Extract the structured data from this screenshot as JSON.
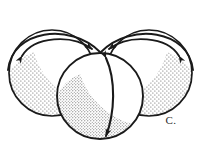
{
  "figure": {
    "panel_label": "C.",
    "background_color": "#ffffff",
    "ink_color": "#1a1a1a",
    "stipple_color": "#3a3a3a",
    "caption_color": "#2b2b2b"
  },
  "spheres": [
    {
      "id": "left-sphere",
      "name": "left-sphere",
      "center_x": 52,
      "center_y": 73,
      "radius_x": 43,
      "radius_y": 43,
      "shaded_region": "lower-left-crescent"
    },
    {
      "id": "right-sphere",
      "name": "right-sphere",
      "center_x": 149,
      "center_y": 73,
      "radius_x": 43,
      "radius_y": 43,
      "shaded_region": "lower-right-crescent"
    },
    {
      "id": "center-sphere",
      "name": "center-sphere",
      "center_x": 100,
      "center_y": 96,
      "radius_x": 43,
      "radius_y": 43,
      "shaded_region": "lower-left-crescent"
    }
  ],
  "arrows": [
    {
      "id": "left-arc-arrow",
      "name": "left-rotation-arc-arrow",
      "style": "double-headed-curved",
      "description": "curved arc above left sphere with arrowheads at both ends",
      "start_label": "left-outer-edge",
      "end_label": "center-sphere-apex"
    },
    {
      "id": "right-arc-arrow",
      "name": "right-rotation-arc-arrow",
      "style": "double-headed-curved",
      "description": "mirrored curved arc above right sphere with arrowheads at both ends",
      "start_label": "center-sphere-apex",
      "end_label": "right-outer-edge"
    },
    {
      "id": "center-meridian-arrow",
      "name": "center-vertical-meridian-arrow",
      "style": "double-headed-vertical",
      "description": "slightly curved vertical double arrow spanning the center sphere from top to bottom",
      "start_label": "center-sphere-top",
      "end_label": "center-sphere-bottom"
    }
  ]
}
